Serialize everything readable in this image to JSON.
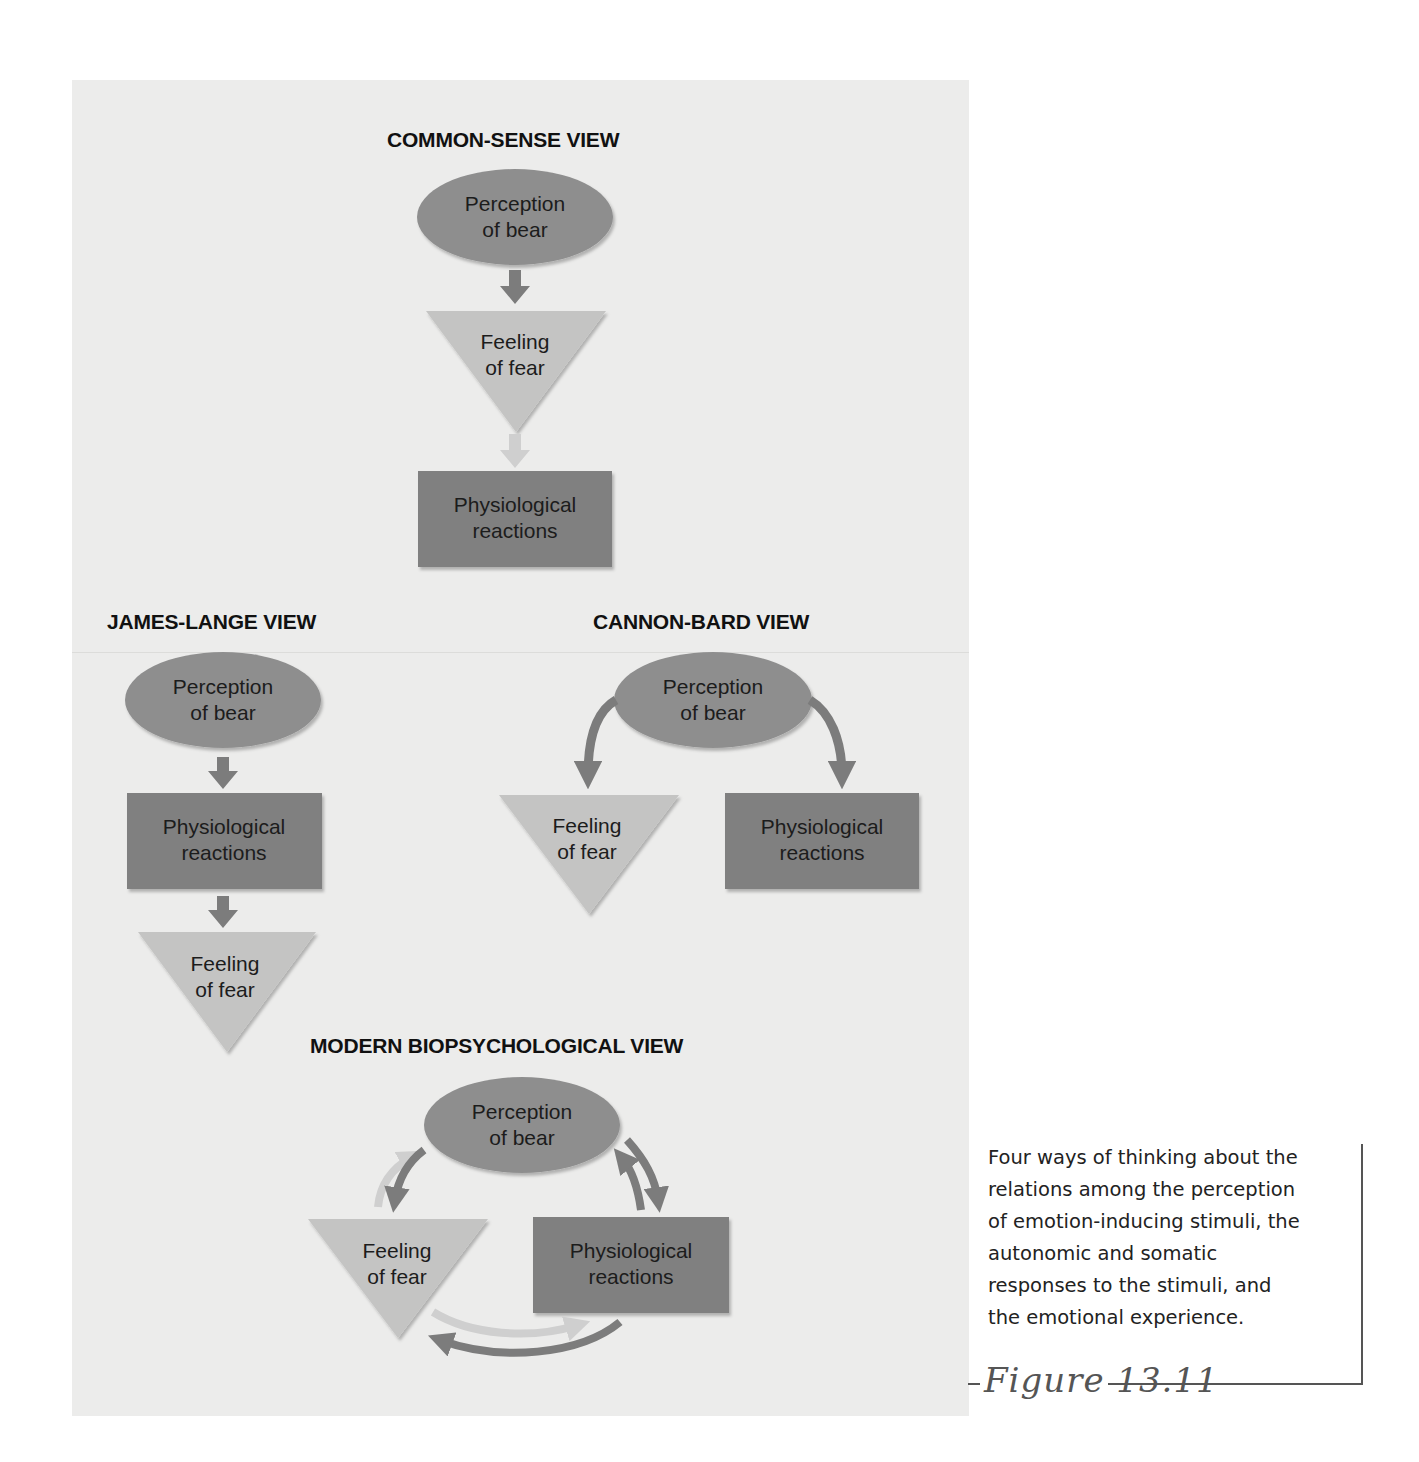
{
  "colors": {
    "panel_bg": "#ececeb",
    "ellipse": "#8e8e8e",
    "rectangle": "#808080",
    "triangle": "#c4c4c3",
    "arrow_dark": "#7c7c7c",
    "arrow_light": "#cfcfcf"
  },
  "views": {
    "common_sense": {
      "title": "COMMON-SENSE VIEW",
      "perception": [
        "Perception",
        "of bear"
      ],
      "feeling": [
        "Feeling",
        "of fear"
      ],
      "physiological": [
        "Physiological",
        "reactions"
      ]
    },
    "james_lange": {
      "title": "JAMES-LANGE VIEW",
      "perception": [
        "Perception",
        "of bear"
      ],
      "physiological": [
        "Physiological",
        "reactions"
      ],
      "feeling": [
        "Feeling",
        "of fear"
      ]
    },
    "cannon_bard": {
      "title": "CANNON-BARD VIEW",
      "perception": [
        "Perception",
        "of bear"
      ],
      "feeling": [
        "Feeling",
        "of fear"
      ],
      "physiological": [
        "Physiological",
        "reactions"
      ]
    },
    "modern": {
      "title": "MODERN BIOPSYCHOLOGICAL VIEW",
      "perception": [
        "Perception",
        "of bear"
      ],
      "feeling": [
        "Feeling",
        "of fear"
      ],
      "physiological": [
        "Physiological",
        "reactions"
      ]
    }
  },
  "caption": {
    "lines": [
      "Four ways of thinking about the",
      "relations among the perception",
      "of emotion-inducing stimuli, the",
      "autonomic and somatic",
      "responses to the stimuli, and",
      "the emotional experience."
    ],
    "figure_label": "Figure 13.11"
  }
}
